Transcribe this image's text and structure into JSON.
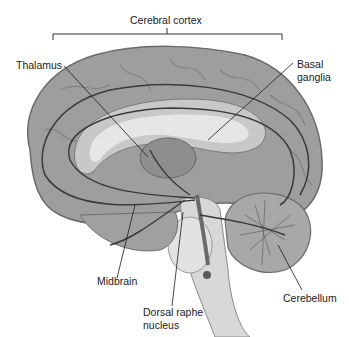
{
  "figure": {
    "type": "anatomical-diagram",
    "colors": {
      "background": "#ffffff",
      "cortex": "#9a9a9a",
      "cortex_light": "#b8b8b8",
      "ventricle": "#e4e4e4",
      "pathway": "#3a3a3a",
      "leader_line": "#1a1a1a"
    }
  },
  "labels": {
    "cerebral_cortex": "Cerebral cortex",
    "thalamus": "Thalamus",
    "basal_ganglia_line1": "Basal",
    "basal_ganglia_line2": "ganglia",
    "midbrain": "Midbrain",
    "dorsal_raphe_line1": "Dorsal raphe",
    "dorsal_raphe_line2": "nucleus",
    "cerebellum": "Cerebellum"
  }
}
